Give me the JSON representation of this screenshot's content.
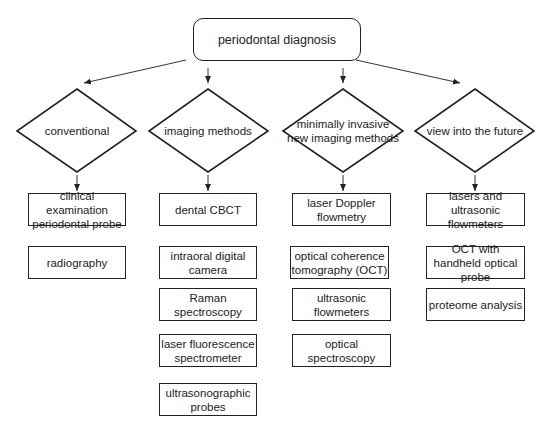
{
  "root": {
    "label": "periodontal diagnosis"
  },
  "categories": [
    {
      "label": "conventional",
      "items": [
        "clinical examination periodontal probe",
        "radiography"
      ]
    },
    {
      "label": "imaging methods",
      "items": [
        "dental CBCT",
        "intraoral digital camera",
        "Raman spectroscopy",
        "laser fluorescence spectrometer",
        "ultrasonographic probes"
      ]
    },
    {
      "label": "minimally invasive new imaging methods",
      "items": [
        "laser Doppler flowmetry",
        "optical coherence tomography (OCT)",
        "ultrasonic flowmeters",
        "optical spectroscopy"
      ]
    },
    {
      "label": "view into the future",
      "items": [
        "lasers and ultrasonic flowmeters",
        "OCT with handheld optical probe",
        "proteome analysis"
      ]
    }
  ]
}
